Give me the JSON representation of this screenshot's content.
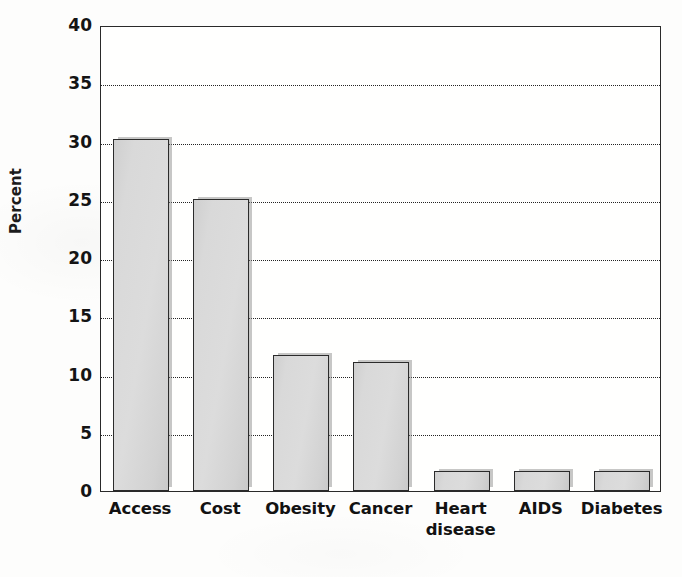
{
  "chart_data": {
    "type": "bar",
    "title": "",
    "subtitle": "",
    "xlabel": "",
    "ylabel": "Percent",
    "categories": [
      "Access",
      "Cost",
      "Obesity",
      "Cancer",
      "Heart disease",
      "AIDS",
      "Diabetes"
    ],
    "category_lines": [
      [
        "Access"
      ],
      [
        "Cost"
      ],
      [
        "Obesity"
      ],
      [
        "Cancer"
      ],
      [
        "Heart",
        "disease"
      ],
      [
        "AIDS"
      ],
      [
        "Diabetes"
      ]
    ],
    "values": [
      30.2,
      25.1,
      11.7,
      11.1,
      1.7,
      1.7,
      1.7
    ],
    "ylim": [
      0,
      40
    ],
    "ytick_values": [
      0,
      5,
      10,
      15,
      20,
      25,
      30,
      35,
      40
    ],
    "ytick_labels": [
      "0",
      "5",
      "10",
      "15",
      "20",
      "25",
      "30",
      "35",
      "40"
    ],
    "grid": "horizontal-dotted",
    "legend": "none",
    "bar_fill_color": "#d8d8d8",
    "bar_edge_color": "#2b2b2b",
    "axis_color": "#2a2a2a",
    "background_color": "#fdfdfc",
    "text_color": "#121212"
  }
}
